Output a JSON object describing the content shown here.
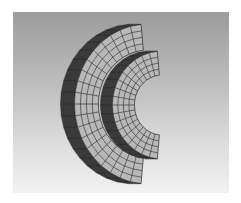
{
  "figure": {
    "colors": {
      "background_top": "#9c9c9c",
      "background_bottom": "#f2f2f2",
      "face_fill": "#b8b8b8",
      "side_fill": "#3a3a3a",
      "mesh_line": "#2a2a2a"
    },
    "parts": [
      {
        "name": "outer-ring",
        "center": [
          148,
          104
        ],
        "outer_radius": 80,
        "inner_radius": 54,
        "thickness_offset": 14,
        "radial_divisions": 4,
        "angular_divisions": 20
      },
      {
        "name": "inner-ring",
        "center": [
          162,
          105
        ],
        "outer_radius": 54,
        "inner_radius": 30,
        "thickness_offset": 12,
        "radial_divisions": 4,
        "angular_divisions": 18
      }
    ]
  }
}
